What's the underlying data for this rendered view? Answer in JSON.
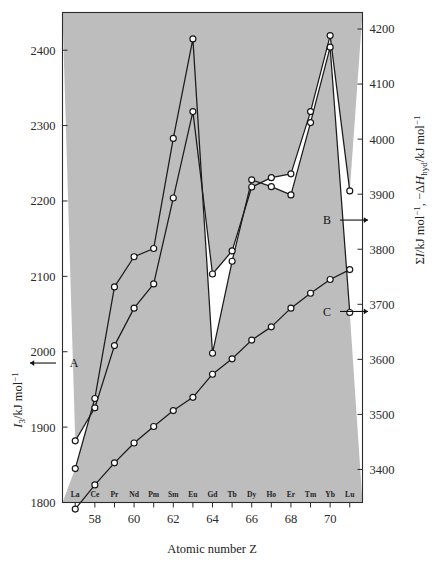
{
  "chart_data": {
    "type": "line",
    "title": "",
    "xlabel": "Atomic number Z",
    "ylabel_left": "I₃/kJ mol⁻¹",
    "ylabel_right": "ΣI/kJ mol⁻¹, −ΔH_hyd/kJ mol⁻¹",
    "x": [
      57,
      58,
      59,
      60,
      61,
      62,
      63,
      64,
      65,
      66,
      67,
      68,
      69,
      70,
      71
    ],
    "element_labels": [
      "La",
      "Ce",
      "Pr",
      "Nd",
      "Pm",
      "Sm",
      "Eu",
      "Gd",
      "Tb",
      "Dy",
      "Ho",
      "Er",
      "Tm",
      "Yb",
      "Lu"
    ],
    "xticks": [
      57,
      58,
      59,
      60,
      61,
      62,
      63,
      64,
      65,
      66,
      67,
      68,
      69,
      70,
      71
    ],
    "xtick_labels": [
      "",
      "58",
      "",
      "60",
      "",
      "62",
      "",
      "64",
      "",
      "66",
      "",
      "68",
      "",
      "70",
      ""
    ],
    "ylim_left": [
      1800,
      2450
    ],
    "yticks_left": [
      1800,
      1900,
      2000,
      2100,
      2200,
      2300,
      2400
    ],
    "ytick_labels_left": [
      "1800",
      "1900",
      "2000",
      "2100",
      "2200",
      "2300",
      "2400"
    ],
    "ylim_right": [
      3340,
      4230
    ],
    "yticks_right": [
      3400,
      3500,
      3600,
      3700,
      3800,
      3900,
      4000,
      4100,
      4200
    ],
    "ytick_labels_right": [
      "3400",
      "3500",
      "3600",
      "3700",
      "3800",
      "3900",
      "4000",
      "4100",
      "4200"
    ],
    "grid": false,
    "legend_position": "inline-arrow-annotations",
    "series": [
      {
        "name": "A",
        "label": "A",
        "axis": "left",
        "quantity": "I₃/kJ mol⁻¹",
        "marker": "open-circle",
        "shaded_below": true,
        "values": [
          1845,
          1938,
          2086,
          2126,
          2137,
          2283,
          2415,
          1998,
          2120,
          2228,
          2219,
          2208,
          2304,
          2404,
          2052
        ]
      },
      {
        "name": "C",
        "label": "C",
        "axis": "right",
        "quantity": "ΣI/kJ mol⁻¹",
        "marker": "open-circle",
        "shaded_below": false,
        "values": [
          3328,
          3372,
          3412,
          3448,
          3478,
          3507,
          3531,
          3573,
          3601,
          3635,
          3659,
          3693,
          3720,
          3745,
          3763
        ]
      },
      {
        "name": "B",
        "label": "B",
        "axis": "right",
        "quantity": "−ΔH_hyd/kJ mol⁻¹",
        "marker": "open-circle",
        "shaded_above": true,
        "values": [
          3452,
          3512,
          3625,
          3693,
          3737,
          3893,
          4050,
          3755,
          3797,
          3913,
          3930,
          3937,
          4050,
          4188,
          3906
        ]
      }
    ],
    "annotations": [
      {
        "label": "A",
        "target_series": "A",
        "arrow": "left",
        "side": "left-axis"
      },
      {
        "label": "B",
        "target_series": "B",
        "arrow": "right",
        "side": "right-axis"
      },
      {
        "label": "C",
        "target_series": "C",
        "arrow": "right",
        "side": "right-axis"
      }
    ]
  },
  "axes": {
    "left_title_parts": {
      "main": "I",
      "sub": "3",
      "unit": "/kJ mol",
      "sup": "−1"
    },
    "right_title_parts": {
      "sigma": "ΣI",
      "unit1": "/kJ mol",
      "sup1": "−1",
      "sep": ", ",
      "delta": "−ΔH",
      "sub2": "hyd",
      "unit2": "/kJ mol",
      "sup2": "−1"
    },
    "x_title": "Atomic number Z"
  }
}
